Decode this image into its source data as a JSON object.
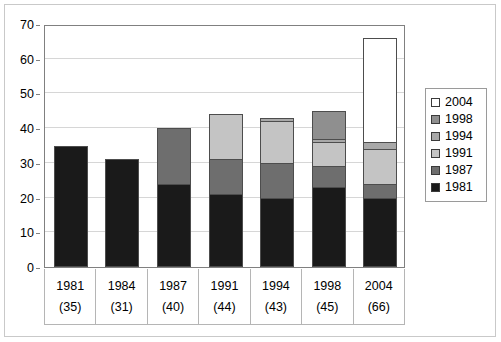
{
  "chart_data": {
    "type": "bar",
    "subtype": "stacked-column",
    "title": "",
    "subtitle": "",
    "xlabel": "",
    "ylabel": "",
    "ylim": [
      0,
      70
    ],
    "yticks": [
      0,
      10,
      20,
      30,
      40,
      50,
      60,
      70
    ],
    "ytick_labels": [
      "0",
      "10",
      "20",
      "30",
      "40",
      "50",
      "60",
      "70"
    ],
    "grid": true,
    "legend_position": "right",
    "categories": [
      "1981",
      "1984",
      "1987",
      "1991",
      "1994",
      "1998",
      "2004"
    ],
    "category_totals": [
      35,
      31,
      40,
      44,
      43,
      45,
      66
    ],
    "category_total_labels": [
      "(35)",
      "(31)",
      "(40)",
      "(44)",
      "(43)",
      "(45)",
      "(66)"
    ],
    "series": [
      {
        "name": "1981",
        "color": "#1a1a1a",
        "values": [
          35,
          31,
          24,
          21,
          20,
          23,
          20
        ]
      },
      {
        "name": "1987",
        "color": "#6e6e6e",
        "values": [
          0,
          0,
          16,
          10,
          10,
          6,
          4
        ]
      },
      {
        "name": "1991",
        "color": "#c4c4c4",
        "values": [
          0,
          0,
          0,
          13,
          12,
          7,
          10
        ]
      },
      {
        "name": "1994",
        "color": "#a8a8a8",
        "values": [
          0,
          0,
          0,
          0,
          1,
          1,
          2
        ]
      },
      {
        "name": "1998",
        "color": "#8f8f8f",
        "values": [
          0,
          0,
          0,
          0,
          0,
          8,
          0
        ]
      },
      {
        "name": "2004",
        "color": "#ffffff",
        "values": [
          0,
          0,
          0,
          0,
          0,
          0,
          30
        ]
      }
    ],
    "legend_entries": [
      {
        "label": "2004",
        "color": "#ffffff"
      },
      {
        "label": "1998",
        "color": "#8f8f8f"
      },
      {
        "label": "1994",
        "color": "#a8a8a8"
      },
      {
        "label": "1991",
        "color": "#c4c4c4"
      },
      {
        "label": "1987",
        "color": "#6e6e6e"
      },
      {
        "label": "1981",
        "color": "#1a1a1a"
      }
    ]
  },
  "colors": {
    "plot_border": "#808080",
    "gridline": "#d6d6d6",
    "figure_border": "#c9c9c9",
    "bar_outline": "#4d4d4d",
    "text": "#000000"
  }
}
